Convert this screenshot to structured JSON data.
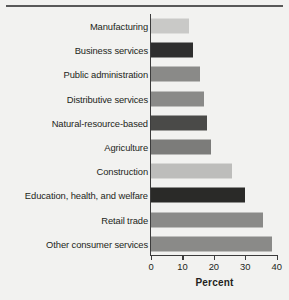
{
  "chart_data": {
    "type": "bar",
    "orientation": "horizontal",
    "title": "",
    "xlabel": "Percent",
    "ylabel": "",
    "xlim": [
      0,
      42
    ],
    "xticks": [
      0,
      10,
      20,
      30,
      40
    ],
    "xtick_labels": [
      "0",
      "10",
      "20",
      "30",
      "40"
    ],
    "grid": false,
    "legend": null,
    "categories": [
      "Manufacturing",
      "Business services",
      "Public administration",
      "Distributive services",
      "Natural-resource-based",
      "Agriculture",
      "Construction",
      "Education, health, and welfare",
      "Retail trade",
      "Other consumer services"
    ],
    "values": [
      12.1,
      13.4,
      15.6,
      16.9,
      17.8,
      19.0,
      25.8,
      29.9,
      35.7,
      38.5
    ],
    "bar_colors": [
      "#c9c9c7",
      "#2e2e2e",
      "#8a8a88",
      "#8a8a88",
      "#4a4a48",
      "#7c7c7a",
      "#bdbdbb",
      "#2a2a28",
      "#8a8a88",
      "#8a8a88"
    ]
  },
  "figure": {
    "background_color": "#f2f2f0",
    "axis_color": "#3b3b3b",
    "text_color": "#231f20",
    "rule_color": "#595959"
  }
}
